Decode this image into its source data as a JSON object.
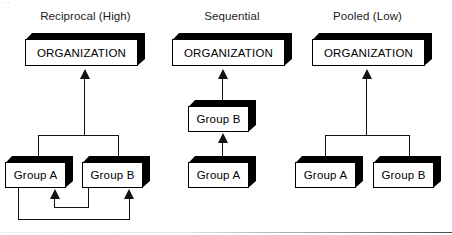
{
  "figure": {
    "type": "diagram",
    "artifacts": {
      "top_cropped_text": "·                                    ·",
      "bottom_rule_present": "true"
    },
    "colors": {
      "line": "#111111",
      "box_fill": "#ffffff",
      "box_shadow": "#000000",
      "text": "#000000",
      "title_text": "#1b1b1b"
    }
  },
  "panels": [
    {
      "id": "reciprocal",
      "title": "Reciprocal (High)",
      "organization_label": "ORGANIZATION",
      "groups": [
        {
          "label": "Group A"
        },
        {
          "label": "Group B"
        }
      ],
      "structure": "Group A and Group B are joined by a bracket that feeds a single arrow up into ORGANIZATION; two nested U-shaped feedback loops connect Group A and Group B to each other in both directions.",
      "arrows": [
        {
          "from": "bracket",
          "to": "ORGANIZATION",
          "head": "up"
        },
        {
          "from": "Group B",
          "to": "Group A",
          "head": "up"
        },
        {
          "from": "Group A",
          "to": "Group B",
          "head": "up"
        }
      ]
    },
    {
      "id": "sequential",
      "title": "Sequential",
      "organization_label": "ORGANIZATION",
      "groups": [
        {
          "label": "Group B"
        },
        {
          "label": "Group A"
        }
      ],
      "structure": "Vertical chain: Group A feeds an arrow up into Group B, which feeds an arrow up into ORGANIZATION.",
      "arrows": [
        {
          "from": "Group A",
          "to": "Group B",
          "head": "up"
        },
        {
          "from": "Group B",
          "to": "ORGANIZATION",
          "head": "up"
        }
      ]
    },
    {
      "id": "pooled",
      "title": "Pooled (Low)",
      "organization_label": "ORGANIZATION",
      "groups": [
        {
          "label": "Group A"
        },
        {
          "label": "Group B"
        }
      ],
      "structure": "Group A and Group B are joined by a bracket that feeds a single arrow up into ORGANIZATION; no arrows connect the groups to each other.",
      "arrows": [
        {
          "from": "bracket",
          "to": "ORGANIZATION",
          "head": "up"
        }
      ]
    }
  ]
}
